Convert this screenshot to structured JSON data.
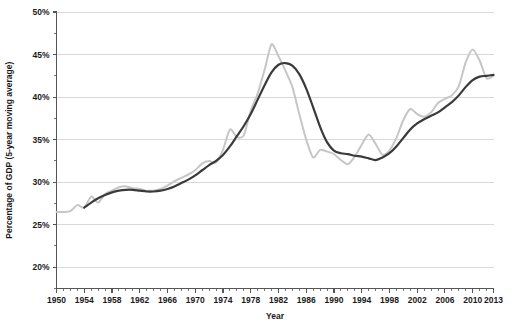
{
  "chart_data": {
    "type": "line",
    "title": "",
    "subtitle": "",
    "xlabel": "Year",
    "ylabel": "Percentage of GDP (5-year moving average)",
    "xlim": [
      1950,
      2013
    ],
    "ylim": [
      17.5,
      50
    ],
    "grid": true,
    "grid_axis": "y",
    "legend": "none",
    "x_tick_labels": [
      "1950",
      "1954",
      "1958",
      "1962",
      "1966",
      "1970",
      "1974",
      "1978",
      "1982",
      "1986",
      "1990",
      "1994",
      "1998",
      "2002",
      "2006",
      "2010",
      "2013"
    ],
    "x_tick_values": [
      1950,
      1954,
      1958,
      1962,
      1966,
      1970,
      1974,
      1978,
      1982,
      1986,
      1990,
      1994,
      1998,
      2002,
      2006,
      2010,
      2013
    ],
    "x_minor_step": 1,
    "y_tick_labels": [
      "20%",
      "25%",
      "30%",
      "35%",
      "40%",
      "45%",
      "50%"
    ],
    "y_tick_values": [
      20,
      25,
      30,
      35,
      40,
      45,
      50
    ],
    "y_minor_step": 2.5,
    "colors": {
      "annual_series": "#c6c6c6",
      "moving_average_series": "#3a3a3a",
      "gridline": "#c9c9c9",
      "axis": "#555555",
      "text": "#1a1a1a",
      "background": "#ffffff"
    },
    "series": [
      {
        "name": "annual",
        "color": "#c6c6c6",
        "width": 2.0,
        "x": [
          1950,
          1951,
          1952,
          1953,
          1954,
          1955,
          1956,
          1957,
          1958,
          1959,
          1960,
          1961,
          1962,
          1963,
          1964,
          1965,
          1966,
          1967,
          1968,
          1969,
          1970,
          1971,
          1972,
          1973,
          1974,
          1975,
          1976,
          1977,
          1978,
          1979,
          1980,
          1981,
          1982,
          1983,
          1984,
          1985,
          1986,
          1987,
          1988,
          1989,
          1990,
          1991,
          1992,
          1993,
          1994,
          1995,
          1996,
          1997,
          1998,
          1999,
          2000,
          2001,
          2002,
          2003,
          2004,
          2005,
          2006,
          2007,
          2008,
          2009,
          2010,
          2011,
          2012,
          2013
        ],
        "values": [
          26.5,
          26.5,
          26.6,
          27.3,
          27.0,
          28.3,
          27.6,
          28.6,
          29.0,
          29.4,
          29.5,
          29.3,
          29.2,
          29.0,
          29.0,
          29.2,
          29.6,
          30.1,
          30.5,
          30.9,
          31.4,
          32.2,
          32.5,
          32.3,
          33.8,
          36.2,
          35.3,
          35.5,
          38.4,
          40.4,
          43.2,
          46.2,
          44.8,
          43.1,
          41.2,
          38.0,
          35.0,
          32.9,
          33.8,
          33.6,
          33.3,
          32.6,
          32.1,
          33.0,
          34.4,
          35.6,
          34.5,
          33.2,
          33.7,
          35.2,
          37.3,
          38.6,
          38.0,
          37.7,
          38.2,
          39.3,
          39.8,
          40.2,
          41.3,
          44.1,
          45.6,
          44.3,
          42.2,
          42.5
        ]
      },
      {
        "name": "5-year moving average",
        "color": "#3a3a3a",
        "width": 2.2,
        "x": [
          1954,
          1955,
          1956,
          1957,
          1958,
          1959,
          1960,
          1961,
          1962,
          1963,
          1964,
          1965,
          1966,
          1967,
          1968,
          1969,
          1970,
          1971,
          1972,
          1973,
          1974,
          1975,
          1976,
          1977,
          1978,
          1979,
          1980,
          1981,
          1982,
          1983,
          1984,
          1985,
          1986,
          1987,
          1988,
          1989,
          1990,
          1991,
          1992,
          1993,
          1994,
          1995,
          1996,
          1997,
          1998,
          1999,
          2000,
          2001,
          2002,
          2003,
          2004,
          2005,
          2006,
          2007,
          2008,
          2009,
          2010,
          2011,
          2012,
          2013
        ],
        "values": [
          27.0,
          27.6,
          28.1,
          28.5,
          28.8,
          29.0,
          29.1,
          29.1,
          29.0,
          28.9,
          28.9,
          29.0,
          29.2,
          29.5,
          29.9,
          30.3,
          30.8,
          31.4,
          32.0,
          32.5,
          33.2,
          34.2,
          35.4,
          36.6,
          38.0,
          39.7,
          41.4,
          42.9,
          43.8,
          44.0,
          43.7,
          42.7,
          41.0,
          38.8,
          36.5,
          34.7,
          33.7,
          33.4,
          33.3,
          33.1,
          33.0,
          32.8,
          32.6,
          32.9,
          33.4,
          34.2,
          35.2,
          36.2,
          36.9,
          37.4,
          37.8,
          38.2,
          38.8,
          39.4,
          40.2,
          41.2,
          42.0,
          42.4,
          42.5,
          42.6
        ]
      }
    ]
  }
}
